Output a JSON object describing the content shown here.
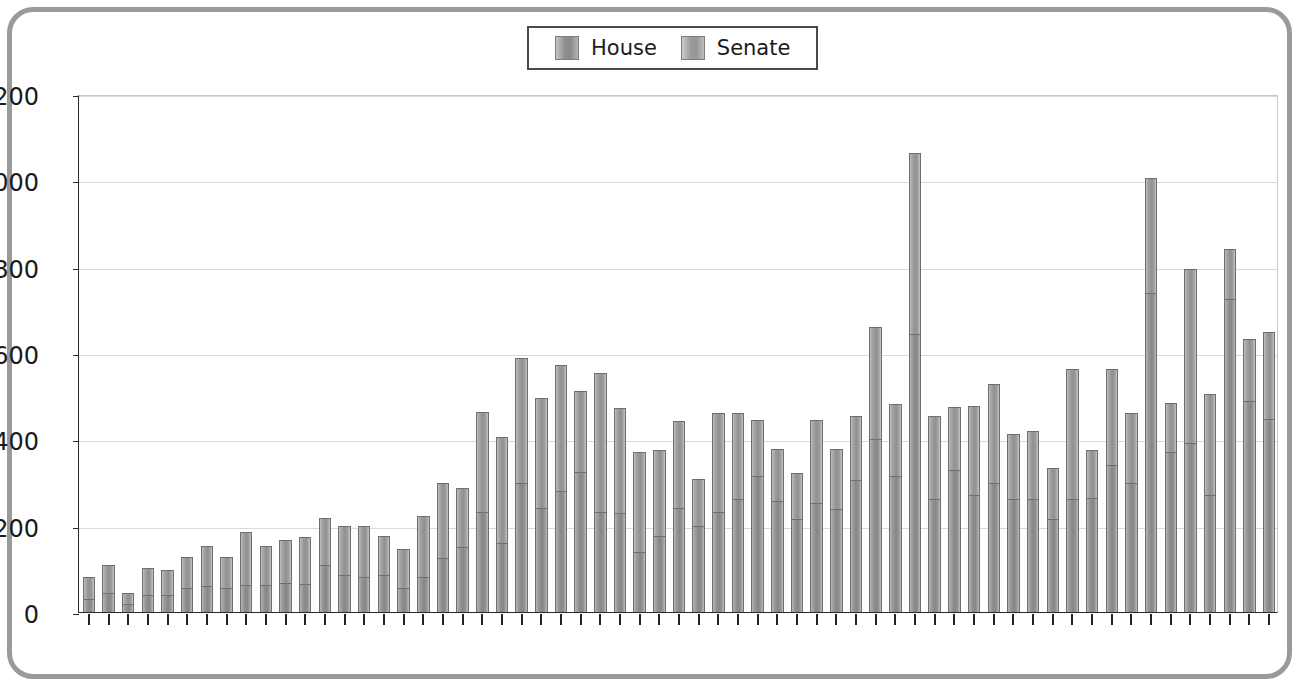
{
  "chart_data": {
    "type": "bar",
    "subtype": "stacked-vertical",
    "title": "",
    "xlabel": "",
    "ylabel": "",
    "ylim": [
      0,
      1200
    ],
    "ytick_step": 200,
    "yticks": [
      0,
      200,
      400,
      600,
      800,
      1000,
      1200
    ],
    "grid": true,
    "legend_position": "top-center",
    "categories": [
      "1953",
      "1954",
      "1955",
      "1956",
      "1957",
      "1958",
      "1959",
      "1960",
      "1961",
      "1962",
      "1963",
      "1964",
      "1965",
      "1966",
      "1967",
      "1968",
      "1969",
      "1970",
      "1971",
      "1972",
      "1973",
      "1974",
      "1975",
      "1976",
      "1977",
      "1978",
      "1979",
      "1980",
      "1981",
      "1982",
      "1983",
      "1984",
      "1985",
      "1986",
      "1987",
      "1988",
      "1989",
      "1990",
      "1991",
      "1992",
      "1993",
      "1994",
      "1995",
      "1996",
      "1997",
      "1998",
      "1999",
      "2000",
      "2001",
      "2002",
      "2003",
      "2004",
      "2005",
      "2006",
      "2007",
      "2008",
      "2009",
      "2010",
      "2011",
      "2012",
      "2013"
    ],
    "series": [
      {
        "name": "House",
        "color": "#8e8e8e",
        "values": [
          30,
          45,
          18,
          40,
          40,
          55,
          60,
          55,
          62,
          62,
          68,
          65,
          110,
          85,
          82,
          85,
          55,
          80,
          125,
          150,
          232,
          160,
          300,
          240,
          280,
          325,
          232,
          230,
          140,
          175,
          240,
          200,
          232,
          262,
          315,
          258,
          215,
          252,
          238,
          305,
          400,
          315,
          645,
          262,
          330,
          270,
          298,
          262,
          262,
          215,
          262,
          265,
          340,
          300,
          740,
          370,
          392,
          272,
          725,
          488,
          448
        ]
      },
      {
        "name": "Senate",
        "color": "#989898",
        "values": [
          52,
          65,
          27,
          62,
          58,
          72,
          92,
          73,
          123,
          90,
          100,
          108,
          108,
          115,
          118,
          90,
          92,
          142,
          175,
          138,
          232,
          245,
          288,
          255,
          292,
          188,
          322,
          242,
          230,
          200,
          203,
          108,
          230,
          200,
          130,
          120,
          108,
          192,
          140,
          148,
          260,
          168,
          418,
          192,
          145,
          208,
          230,
          150,
          158,
          118,
          300,
          110,
          223,
          160,
          265,
          115,
          403,
          232,
          115,
          145,
          200
        ]
      }
    ],
    "totals": [
      82,
      110,
      45,
      102,
      98,
      127,
      152,
      128,
      185,
      152,
      168,
      173,
      218,
      200,
      200,
      175,
      147,
      222,
      300,
      288,
      464,
      405,
      588,
      495,
      572,
      513,
      554,
      472,
      370,
      375,
      443,
      308,
      462,
      462,
      445,
      378,
      323,
      444,
      378,
      453,
      660,
      483,
      1063,
      454,
      475,
      478,
      528,
      412,
      420,
      333,
      562,
      375,
      563,
      460,
      1005,
      485,
      795,
      504,
      840,
      633,
      648
    ]
  },
  "legend": {
    "items": [
      {
        "label": "House",
        "swatch": "house-swatch"
      },
      {
        "label": "Senate",
        "swatch": "senate-swatch"
      }
    ]
  }
}
